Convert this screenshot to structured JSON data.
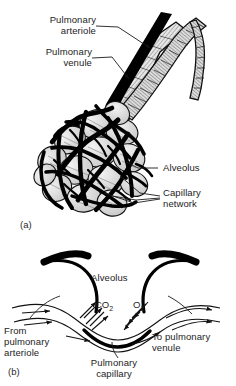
{
  "figure": {
    "background_color": "#ffffff",
    "ink_color": "#000000"
  },
  "panel_a": {
    "id": "(a)",
    "labels": {
      "pulmonary_arteriole": "Pulmonary\narteriole",
      "pulmonary_venule": "Pulmonary\nvenule",
      "alveolus": "Alveolus",
      "capillary_network": "Capillary\nnetwork"
    }
  },
  "panel_b": {
    "id": "(b)",
    "labels": {
      "alveolus": "Alveolus",
      "from_pulmonary_arteriole": "From\npulmonary\narteriole",
      "to_pulmonary_venule": "To pulmonary\nvenule",
      "pulmonary_capillary": "Pulmonary\ncapillary"
    },
    "gases": {
      "carbon_dioxide": "CO",
      "carbon_dioxide_sub": "2",
      "oxygen": "O",
      "oxygen_sub": "2"
    }
  }
}
